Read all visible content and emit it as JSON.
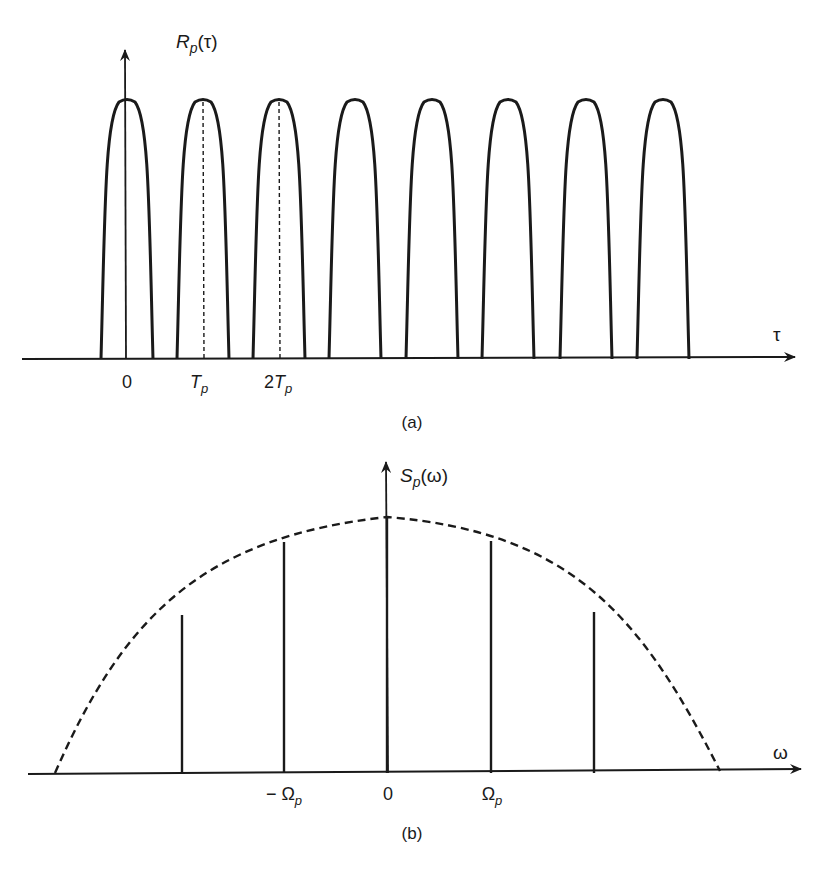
{
  "panel_a": {
    "caption": "(a)",
    "y_axis_label": {
      "main": "R",
      "sub": "p",
      "arg": "(τ)"
    },
    "x_axis_label": "τ",
    "tick_labels": [
      {
        "text": "0",
        "x": 127
      },
      {
        "text": "T",
        "sub": "p",
        "x": 203
      },
      {
        "text": "2T",
        "sub": "p",
        "x": 279
      }
    ],
    "pulse_centers": [
      127,
      203,
      279,
      355,
      432,
      508,
      586,
      663
    ],
    "pulse_half_width": 26,
    "baseline_y": 359,
    "peak_y": 100,
    "dashed_markers_at": [
      203,
      279
    ]
  },
  "panel_b": {
    "caption": "(b)",
    "y_axis_label": {
      "main": "S",
      "sub": "p",
      "arg": "(ω)"
    },
    "x_axis_label": "ω",
    "tick_labels": [
      {
        "text": "− Ω",
        "sub": "p",
        "x": 284
      },
      {
        "text": "0",
        "x": 387
      },
      {
        "text": "Ω",
        "sub": "p",
        "x": 491
      }
    ],
    "spectral_lines": [
      {
        "x": 182,
        "top": 615
      },
      {
        "x": 284,
        "top": 542
      },
      {
        "x": 387,
        "top": 517
      },
      {
        "x": 491,
        "top": 541
      },
      {
        "x": 594,
        "top": 612
      }
    ],
    "envelope": {
      "left_x": 55,
      "right_x": 720,
      "peak_x": 387,
      "peak_y": 517,
      "style": "dashed"
    },
    "baseline_y": 773
  }
}
